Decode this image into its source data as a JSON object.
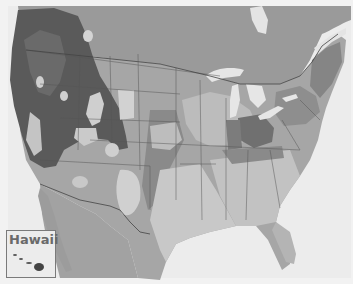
{
  "map": {
    "region": "Contiguous United States with surrounding Canada and Mexico",
    "style": "grayscale shaded-relief with categorical zones",
    "colors": {
      "background": "#f2f2f2",
      "ocean": "#ececec",
      "land_base": "#9a9a9a",
      "mountains_dark": "#5a5a5a",
      "zone_light": "#c8c8c8",
      "zone_mid": "#a8a8a8",
      "zone_dark": "#7c7c7c",
      "water_lakes": "#e4e4e4",
      "borders": "#555555"
    }
  },
  "inset": {
    "label": "Hawaii"
  }
}
